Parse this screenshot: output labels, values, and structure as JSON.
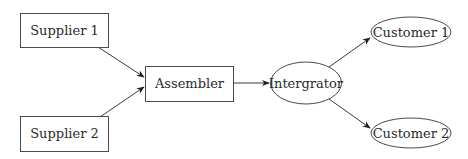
{
  "diagram": {
    "type": "flowchart",
    "nodes": [
      {
        "id": "supplier1",
        "label": "Supplier 1",
        "shape": "rectangle"
      },
      {
        "id": "supplier2",
        "label": "Supplier 2",
        "shape": "rectangle"
      },
      {
        "id": "assembler",
        "label": "Assembler",
        "shape": "rectangle"
      },
      {
        "id": "integrator",
        "label": "Intergrator",
        "shape": "ellipse"
      },
      {
        "id": "customer1",
        "label": "Customer 1",
        "shape": "ellipse"
      },
      {
        "id": "customer2",
        "label": "Customer 2",
        "shape": "ellipse"
      }
    ],
    "edges": [
      {
        "from": "supplier1",
        "to": "assembler"
      },
      {
        "from": "supplier2",
        "to": "assembler"
      },
      {
        "from": "assembler",
        "to": "integrator"
      },
      {
        "from": "integrator",
        "to": "customer1"
      },
      {
        "from": "integrator",
        "to": "customer2"
      }
    ],
    "colors": {
      "background": "#ffffff",
      "stroke": "#4a4a4a",
      "text": "#2a2a2a"
    }
  }
}
